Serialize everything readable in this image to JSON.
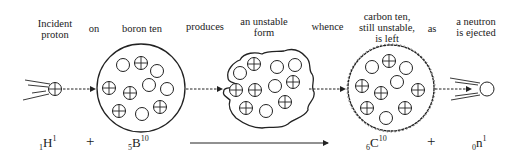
{
  "labels": {
    "incident_proton": "Incident\nproton",
    "on": "on",
    "boron_ten": "boron ten",
    "produces": "produces",
    "unstable_form": "an unstable\nform",
    "whence": "whence",
    "carbon_ten": "carbon ten,\nstill unstable,\nis left",
    "as": "as",
    "neutron_ejected": "a neutron\nis ejected"
  },
  "equation": {
    "proton": {
      "atomic_number": "1",
      "symbol": "H",
      "mass_number": "1"
    },
    "plus1": "+",
    "boron": {
      "atomic_number": "5",
      "symbol": "B",
      "mass_number": "10"
    },
    "carbon": {
      "atomic_number": "6",
      "symbol": "C",
      "mass_number": "10"
    },
    "plus2": "+",
    "neutron": {
      "atomic_number": "0",
      "symbol": "n",
      "mass_number": "1"
    }
  },
  "legend": {
    "proton_glyph": "circle-with-cross",
    "neutron_glyph": "empty-circle"
  }
}
